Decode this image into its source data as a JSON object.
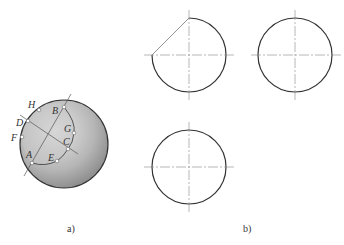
{
  "figure": {
    "panel_a": {
      "caption": "a)",
      "sphere": {
        "cx": 64,
        "cy": 144,
        "r": 44,
        "fill_light": "#e6e6e6",
        "fill_dark": "#8a8a8a",
        "stroke": "#333333"
      },
      "points": [
        {
          "name": "H",
          "label": "H",
          "x": 39,
          "y": 110,
          "lx": 28,
          "ly": 108
        },
        {
          "name": "B",
          "label": "B",
          "x": 64,
          "y": 107,
          "lx": 52,
          "ly": 114
        },
        {
          "name": "D",
          "label": "D",
          "x": 28,
          "y": 121,
          "lx": 16,
          "ly": 126
        },
        {
          "name": "F",
          "label": "F",
          "x": 22,
          "y": 137,
          "lx": 11,
          "ly": 141
        },
        {
          "name": "G",
          "label": "G",
          "x": 74,
          "y": 133,
          "lx": 64,
          "ly": 132
        },
        {
          "name": "C",
          "label": "C",
          "x": 68,
          "y": 149,
          "lx": 63,
          "ly": 145
        },
        {
          "name": "A",
          "label": "A",
          "x": 32,
          "y": 163,
          "lx": 26,
          "ly": 158
        },
        {
          "name": "E",
          "label": "E",
          "x": 57,
          "y": 161,
          "lx": 48,
          "ly": 161
        }
      ]
    },
    "panel_b": {
      "caption": "b)",
      "circles": [
        {
          "name": "front-view",
          "cx": 189,
          "cy": 55,
          "r": 37,
          "cut": true
        },
        {
          "name": "side-view",
          "cx": 295,
          "cy": 55,
          "r": 37,
          "cut": false
        },
        {
          "name": "top-view",
          "cx": 189,
          "cy": 167,
          "r": 37,
          "cut": false
        }
      ]
    }
  }
}
